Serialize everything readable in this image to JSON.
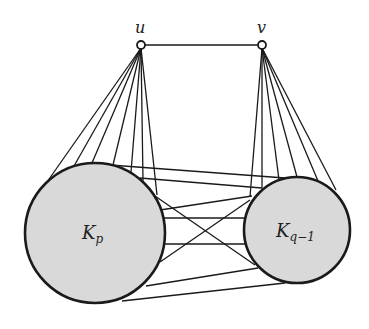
{
  "diagram": {
    "vertices": [
      {
        "id": "u",
        "label": "u",
        "x": 141,
        "y": 45
      },
      {
        "id": "v",
        "label": "v",
        "x": 262,
        "y": 45
      }
    ],
    "cliques": [
      {
        "id": "Kp",
        "label_main": "K",
        "label_sub": "p",
        "cx": 95,
        "cy": 233,
        "r": 70
      },
      {
        "id": "Kq1",
        "label_main": "K",
        "label_sub": "q−1",
        "cx": 297,
        "cy": 230,
        "r": 53
      }
    ],
    "fill_color": "#d9d9d9",
    "stroke_color": "#1a1a1a"
  }
}
